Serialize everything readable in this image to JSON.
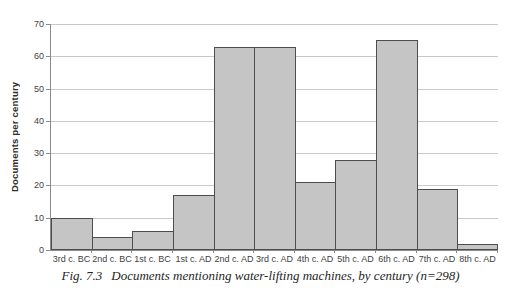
{
  "figure": {
    "caption_fig_label": "Fig. 7.3",
    "caption_text": "Documents mentioning water-lifting machines, by century (n=298)"
  },
  "chart_data": {
    "type": "bar",
    "title": "",
    "xlabel": "",
    "ylabel": "Documents per century",
    "categories": [
      "3rd c. BC",
      "2nd c. BC",
      "1st c. BC",
      "1st c. AD",
      "2nd c. AD",
      "3rd c. AD",
      "4th c. AD",
      "5th c. AD",
      "6th c. AD",
      "7th c. AD",
      "8th c. AD"
    ],
    "values": [
      10,
      4,
      6,
      17,
      63,
      63,
      21,
      28,
      65,
      19,
      2
    ],
    "n_total": 298,
    "ylim": [
      0,
      70
    ],
    "yticks": [
      0,
      10,
      20,
      30,
      40,
      50,
      60,
      70
    ],
    "grid": "horizontal",
    "legend_position": "none",
    "bar_gap": 0,
    "colors": {
      "bar_fill": "#c5c5c5",
      "bar_border": "#4d4d4d",
      "gridline": "#c9c9c9",
      "axis_line": "#8c8c8c",
      "tick_text": "#3f3f3f",
      "caption_text": "#262626",
      "background": "#ffffff"
    }
  }
}
